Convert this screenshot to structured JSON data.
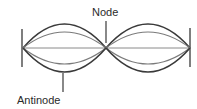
{
  "diagram": {
    "labels": {
      "node": "Node",
      "antinode": "Antinode"
    },
    "geometry": {
      "left_end_x": 23,
      "node_x": 106,
      "right_end_x": 190,
      "axis_y": 48,
      "outer_amplitude": 24,
      "inner_amplitude": 16
    },
    "colors": {
      "outer_curve": "#3a3a3a",
      "inner_curve": "#7a7a7a",
      "axis": "#8a8a8a",
      "markers": "#3a3a3a",
      "text": "#2a2a2a",
      "background": "#ffffff"
    }
  }
}
